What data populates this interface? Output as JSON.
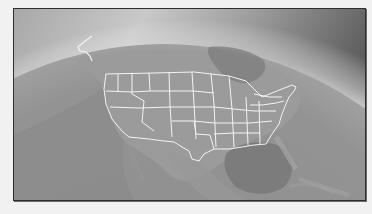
{
  "image": {
    "subject": "Earth from orbit showing North America with United States state borders",
    "style": "grayscale",
    "caption": "United States on globe",
    "colors": {
      "page_background": "#f1f1f1",
      "frame_border": "#2e2e2e",
      "space_dark": "#555555",
      "atmosphere_glow": "#e8e8e8",
      "land": "#9a9a9a",
      "ocean": "#8c8c8c",
      "gulf_dark": "#7c7c7c",
      "borders": "#f4f4f4"
    }
  }
}
